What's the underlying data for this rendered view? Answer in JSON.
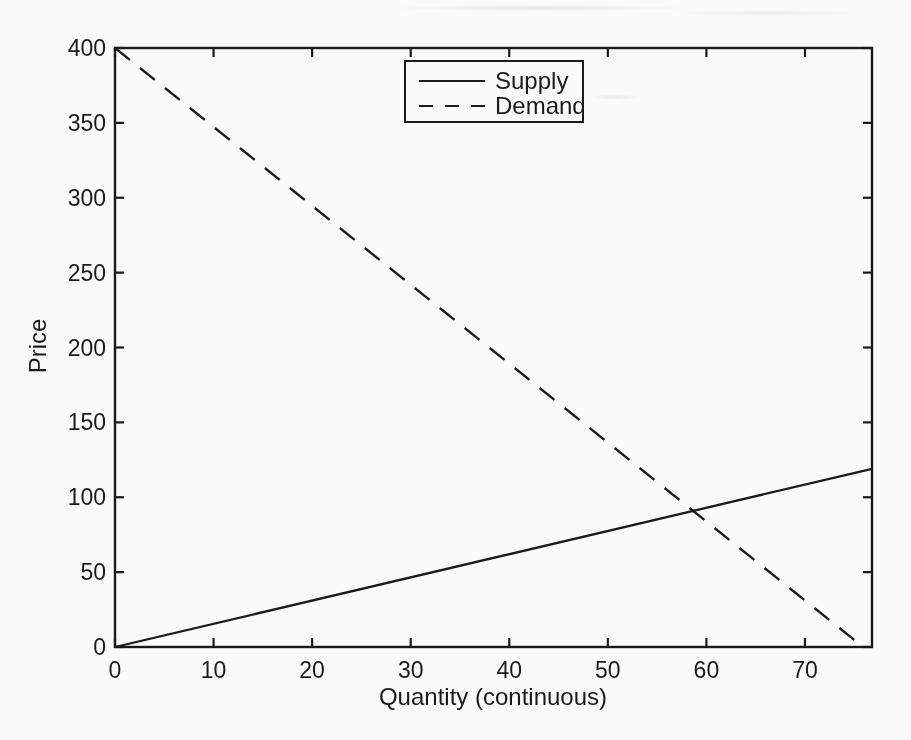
{
  "style": {
    "ink_color": "#1a1a1a",
    "background_color": "#fafaf8"
  },
  "chart_data": {
    "type": "line",
    "title": "",
    "xlabel": "Quantity (continuous)",
    "ylabel": "Price",
    "xlim": [
      0,
      76.8
    ],
    "ylim": [
      0,
      400
    ],
    "x_ticks": [
      0,
      10,
      20,
      30,
      40,
      50,
      60,
      70
    ],
    "y_ticks": [
      0,
      50,
      100,
      150,
      200,
      250,
      300,
      350,
      400
    ],
    "grid": false,
    "legend_position": "top-center",
    "series": [
      {
        "name": "Supply",
        "line_style": "solid",
        "x": [
          0,
          76.8
        ],
        "y": [
          0,
          119
        ]
      },
      {
        "name": "Demand",
        "line_style": "dashed",
        "x": [
          0,
          75.9
        ],
        "y": [
          400,
          0
        ]
      }
    ]
  }
}
